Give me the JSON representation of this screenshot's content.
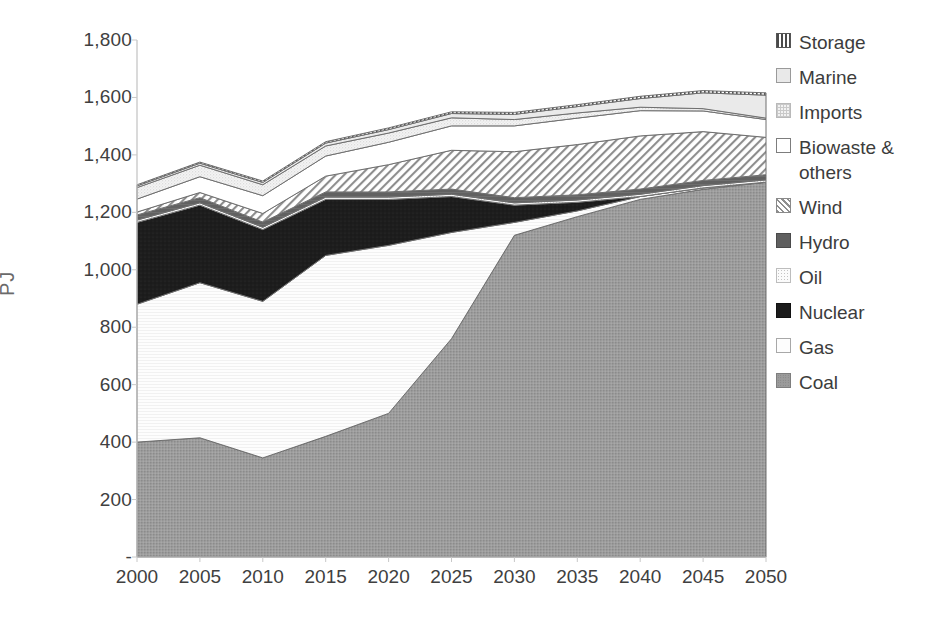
{
  "chart_data": {
    "type": "area",
    "stacked": true,
    "title": "",
    "xlabel": "",
    "ylabel": "PJ",
    "x": [
      2000,
      2005,
      2010,
      2015,
      2020,
      2025,
      2030,
      2035,
      2040,
      2045,
      2050
    ],
    "categories": [
      "2000",
      "2005",
      "2010",
      "2015",
      "2020",
      "2025",
      "2030",
      "2035",
      "2040",
      "2045",
      "2050"
    ],
    "xlim": [
      2000,
      2050
    ],
    "ylim": [
      0,
      1800
    ],
    "y_ticks": [
      0,
      200,
      400,
      600,
      800,
      1000,
      1200,
      1400,
      1600,
      1800
    ],
    "y_tick_labels": [
      "-",
      "200",
      "400",
      "600",
      "800",
      "1,000",
      "1,200",
      "1,400",
      "1,600",
      "1,800"
    ],
    "grid": false,
    "legend_position": "right",
    "stack_order_bottom_to_top": [
      "Coal",
      "Gas",
      "Nuclear",
      "Oil",
      "Hydro",
      "Wind",
      "Biowaste & others",
      "Imports",
      "Marine",
      "Storage"
    ],
    "series": [
      {
        "name": "Coal",
        "key": "coal",
        "values": [
          400,
          415,
          345,
          420,
          500,
          760,
          1120,
          1185,
          1245,
          1280,
          1305
        ]
      },
      {
        "name": "Gas",
        "key": "gas",
        "values": [
          480,
          540,
          545,
          630,
          585,
          370,
          45,
          20,
          10,
          5,
          0
        ]
      },
      {
        "name": "Nuclear",
        "key": "nuclear",
        "values": [
          285,
          270,
          250,
          195,
          160,
          125,
          60,
          30,
          0,
          0,
          0
        ]
      },
      {
        "name": "Oil",
        "key": "oil",
        "values": [
          8,
          8,
          8,
          8,
          8,
          8,
          8,
          8,
          8,
          8,
          8
        ]
      },
      {
        "name": "Hydro",
        "key": "hydro",
        "values": [
          18,
          18,
          18,
          18,
          18,
          18,
          18,
          18,
          18,
          18,
          18
        ]
      },
      {
        "name": "Wind",
        "key": "wind",
        "values": [
          10,
          18,
          30,
          55,
          95,
          135,
          160,
          175,
          185,
          170,
          130
        ]
      },
      {
        "name": "Biowaste & others",
        "key": "biowaste",
        "values": [
          45,
          55,
          62,
          70,
          78,
          85,
          90,
          92,
          88,
          72,
          62
        ]
      },
      {
        "name": "Imports",
        "key": "imports",
        "values": [
          40,
          40,
          38,
          35,
          32,
          28,
          22,
          18,
          12,
          8,
          5
        ]
      },
      {
        "name": "Marine",
        "key": "marine",
        "values": [
          6,
          7,
          8,
          10,
          12,
          15,
          18,
          22,
          30,
          55,
          80
        ]
      },
      {
        "name": "Storage",
        "key": "storage",
        "values": [
          4,
          4,
          5,
          5,
          6,
          6,
          7,
          7,
          8,
          8,
          8
        ]
      }
    ],
    "stack_totals": [
      1296,
      1375,
      1309,
      1436,
      1494,
      1550,
      1548,
      1555,
      1574,
      1624,
      1616
    ]
  },
  "legend": {
    "items": [
      {
        "label": "Storage",
        "swatch": "sw-storage",
        "icon": "vertical-bars-swatch-icon"
      },
      {
        "label": "Marine",
        "swatch": "sw-marine",
        "icon": "light-gray-swatch-icon"
      },
      {
        "label": "Imports",
        "swatch": "sw-imports",
        "icon": "dotted-grid-swatch-icon"
      },
      {
        "label": "Biowaste &\nothers",
        "swatch": "sw-biowaste",
        "icon": "white-swatch-icon"
      },
      {
        "label": "Wind",
        "swatch": "sw-wind",
        "icon": "diagonal-hatch-swatch-icon"
      },
      {
        "label": "Hydro",
        "swatch": "sw-hydro",
        "icon": "dark-gray-swatch-icon"
      },
      {
        "label": "Oil",
        "swatch": "sw-oil",
        "icon": "fine-dots-swatch-icon"
      },
      {
        "label": "Nuclear",
        "swatch": "sw-nuclear",
        "icon": "black-swatch-icon"
      },
      {
        "label": "Gas",
        "swatch": "sw-gas",
        "icon": "white-outline-swatch-icon"
      },
      {
        "label": "Coal",
        "swatch": "sw-coal",
        "icon": "gray-speckle-swatch-icon"
      }
    ]
  },
  "colors": {
    "coal": "#9b9b9b",
    "gas": "#fdfdfd",
    "nuclear": "#1b1b1b",
    "oil": "#fbfbfb",
    "hydro": "#5f5f5f",
    "wind": "#ffffff",
    "biowaste": "#ffffff",
    "imports": "#f2f2f2",
    "marine": "#e9e9e9",
    "storage": "#ffffff",
    "axis": "#bfbfbf",
    "text": "#404040"
  }
}
